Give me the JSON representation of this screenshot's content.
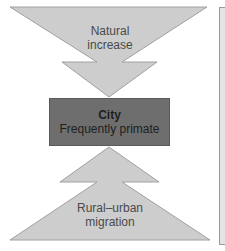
{
  "diagram": {
    "top_arrow": {
      "label": "Natural increase",
      "line1": "Natural",
      "line2": "increase",
      "direction": "down"
    },
    "center_box": {
      "title": "City",
      "subtitle": "Frequently primate"
    },
    "bottom_arrow": {
      "label": "Rural–urban migration",
      "line1": "Rural–urban",
      "line2": "migration",
      "direction": "up"
    }
  },
  "colors": {
    "arrow_fill": "#cdcdcd",
    "arrow_stroke": "#9a9a9a",
    "box_fill": "#6e6e6e",
    "text": "#4a4a4a",
    "box_text": "#1e1e1e",
    "panel_fill": "#e4e4e4"
  }
}
